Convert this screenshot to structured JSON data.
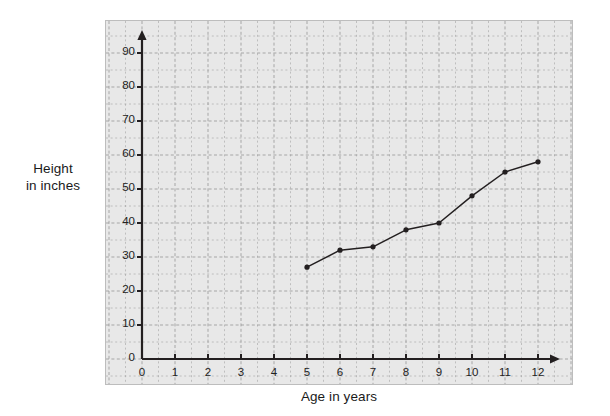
{
  "chart_data": {
    "type": "line",
    "title": "",
    "subtitle": "",
    "xlabel": "Age in years",
    "ylabel": "Height in inches",
    "ylabel_lines": [
      "Height",
      "in inches"
    ],
    "x": [
      5,
      6,
      7,
      8,
      9,
      10,
      11,
      12
    ],
    "values": [
      27,
      32,
      33,
      38,
      40,
      48,
      55,
      58
    ],
    "series": [
      {
        "name": "Height",
        "x": [
          5,
          6,
          7,
          8,
          9,
          10,
          11,
          12
        ],
        "values": [
          27,
          32,
          33,
          38,
          40,
          48,
          55,
          58
        ]
      }
    ],
    "xlim": [
      0,
      13
    ],
    "ylim": [
      0,
      95
    ],
    "xticks": [
      0,
      1,
      2,
      3,
      4,
      5,
      6,
      7,
      8,
      9,
      10,
      11,
      12
    ],
    "xtick_labels": [
      "0",
      "1",
      "2",
      "3",
      "4",
      "5",
      "6",
      "7",
      "8",
      "9",
      "10",
      "11",
      "12"
    ],
    "yticks": [
      0,
      10,
      20,
      30,
      40,
      50,
      60,
      70,
      80,
      90
    ],
    "ytick_labels": [
      "0",
      "10",
      "20",
      "30",
      "40",
      "50",
      "60",
      "70",
      "80",
      "90"
    ],
    "minor_grid_step_x": 0.5,
    "minor_grid_step_y": 5,
    "grid": true,
    "grid_style": "dashed",
    "legend": false,
    "legend_position": "none",
    "marker": "filled-circle",
    "axis_arrows": true,
    "colors": {
      "plot_background": "#e8e8e8",
      "grid_line": "#9a9a9a",
      "axis_line": "#231f20",
      "series_line": "#231f20",
      "marker_fill": "#231f20",
      "text": "#1a1a1a",
      "panel_border": "#bdbdbd",
      "page_background": "#ffffff"
    }
  },
  "geometry": {
    "origin_x_px": 36,
    "origin_y_px": 338,
    "px_per_x_unit": 33.0,
    "px_per_y_unit": 3.4
  }
}
